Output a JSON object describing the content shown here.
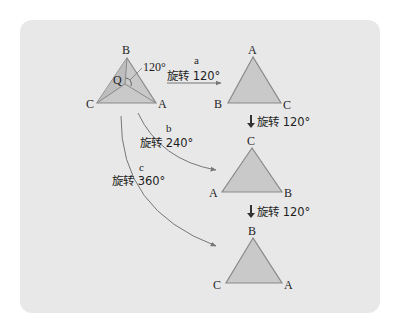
{
  "colors": {
    "panel_bg": "#e8e8e8",
    "triangle_fill": "#c9c9c9",
    "triangle_stroke": "#8a8a8a",
    "arrow": "#777777",
    "text": "#1e1e1e"
  },
  "source_triangle": {
    "vertices": {
      "top": "B",
      "left": "C",
      "right": "A"
    },
    "center_label": "Q",
    "angle_label": "120°"
  },
  "arrows": {
    "a": {
      "letter": "a",
      "label": "旋转 120°"
    },
    "b": {
      "letter": "b",
      "label": "旋转 240°"
    },
    "c": {
      "letter": "c",
      "label": "旋转 360°"
    }
  },
  "results": [
    {
      "id": "after_a",
      "top": "A",
      "left": "B",
      "right": "C"
    },
    {
      "id": "after_b",
      "top": "C",
      "left": "A",
      "right": "B"
    },
    {
      "id": "after_c",
      "top": "B",
      "left": "C",
      "right": "A"
    }
  ],
  "step_arrows": [
    {
      "arrow": "↓",
      "label": "旋转 120°"
    },
    {
      "arrow": "↓",
      "label": "旋转 120°"
    }
  ]
}
